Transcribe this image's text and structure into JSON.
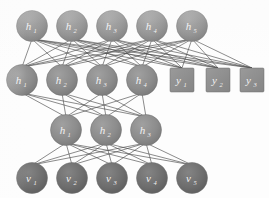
{
  "figure": {
    "type": "neural-network-diagram",
    "background_color": "#fdfdfd",
    "node_fill_hidden": "#8c8c8c",
    "node_fill_visible": "#6e6e6e",
    "node_fill_output": "#8f8f8f",
    "edge_color": "#4a4a4a",
    "label_color": "#f2f2f2"
  },
  "layers": [
    {
      "id": "layer-h-top",
      "name": "top-hidden-layer",
      "shape": "circle",
      "y": 26,
      "radius": 15.5,
      "fill": "#8c8c8c",
      "nodes": [
        {
          "base": "h",
          "sub": "1",
          "x": 32
        },
        {
          "base": "h",
          "sub": "2",
          "x": 72
        },
        {
          "base": "h",
          "sub": "3",
          "x": 112
        },
        {
          "base": "h",
          "sub": "4",
          "x": 152
        },
        {
          "base": "h",
          "sub": "5",
          "x": 192
        }
      ]
    },
    {
      "id": "layer-h-second",
      "name": "second-hidden-layer",
      "shape": "circle",
      "y": 80,
      "radius": 15.5,
      "fill": "#8c8c8c",
      "nodes": [
        {
          "base": "h",
          "sub": "1",
          "x": 22
        },
        {
          "base": "h",
          "sub": "2",
          "x": 62
        },
        {
          "base": "h",
          "sub": "3",
          "x": 102
        },
        {
          "base": "h",
          "sub": "4",
          "x": 142
        }
      ]
    },
    {
      "id": "layer-y-output",
      "name": "output-layer",
      "shape": "square",
      "y": 80,
      "size": 24,
      "fill": "#8f8f8f",
      "nodes": [
        {
          "base": "y",
          "sub": "1",
          "x": 182
        },
        {
          "base": "y",
          "sub": "2",
          "x": 218
        },
        {
          "base": "y",
          "sub": "3",
          "x": 252
        }
      ]
    },
    {
      "id": "layer-h-third",
      "name": "third-hidden-layer",
      "shape": "circle",
      "y": 130,
      "radius": 15.5,
      "fill": "#8c8c8c",
      "nodes": [
        {
          "base": "h",
          "sub": "1",
          "x": 66
        },
        {
          "base": "h",
          "sub": "2",
          "x": 106
        },
        {
          "base": "h",
          "sub": "3",
          "x": 146
        }
      ]
    },
    {
      "id": "layer-v-visible",
      "name": "visible-layer",
      "shape": "circle",
      "y": 178,
      "radius": 15.5,
      "fill": "#6e6e6e",
      "nodes": [
        {
          "base": "v",
          "sub": "1",
          "x": 32
        },
        {
          "base": "v",
          "sub": "2",
          "x": 72
        },
        {
          "base": "v",
          "sub": "3",
          "x": 112
        },
        {
          "base": "v",
          "sub": "4",
          "x": 152
        },
        {
          "base": "v",
          "sub": "5",
          "x": 192
        }
      ]
    }
  ],
  "connections": [
    {
      "from": "layer-h-second",
      "to": "layer-h-top",
      "style": "fully-connected"
    },
    {
      "from": "layer-y-output",
      "to": "layer-h-top",
      "style": "fully-connected"
    },
    {
      "from": "layer-h-third",
      "to": "layer-h-second",
      "style": "fully-connected"
    },
    {
      "from": "layer-v-visible",
      "to": "layer-h-third",
      "style": "fully-connected"
    }
  ]
}
